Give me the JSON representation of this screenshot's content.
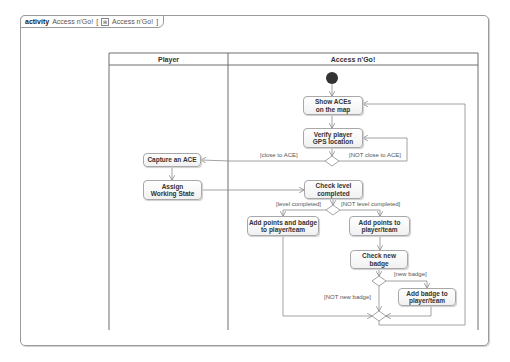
{
  "frame": {
    "keyword": "activity",
    "name": "Access n'Go!",
    "bracket_open": "[",
    "icon": "activity-diagram-icon",
    "diagram_ref": "Access n'Go!",
    "bracket_close": "]"
  },
  "swimlanes": [
    {
      "label": "Player"
    },
    {
      "label": "Access n'Go!"
    }
  ],
  "nodes": {
    "show_aces": "Show ACEs\non the map",
    "verify_gps": "Verify player\nGPS location",
    "capture_ace": "Capture an ACE",
    "assign_state": "Assign\nWorking State",
    "check_level": "Check level\ncompleted",
    "add_points_badge": "Add points and badge\nto player/team",
    "add_points": "Add points to\nplayer/team",
    "check_badge": "Check new\nbadge",
    "add_badge": "Add badge to\nplayer/team"
  },
  "guards": {
    "close": "[close to ACE]",
    "not_close": "[NOT close to ACE]",
    "level_completed": "[level completed]",
    "not_level_completed": "[NOT level completed]",
    "new_badge": "[new badge]",
    "not_new_badge": "[NOT new badge]"
  },
  "colors": {
    "line": "#8c8c8c",
    "initial_node": "#333333",
    "node_border": "#a8a8a8"
  }
}
